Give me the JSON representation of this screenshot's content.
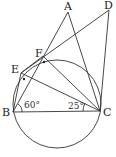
{
  "diagram": {
    "points": {
      "A": {
        "label": "A",
        "x": 68,
        "y": 12
      },
      "B": {
        "label": "B",
        "x": 13,
        "y": 112
      },
      "C": {
        "label": "C",
        "x": 100,
        "y": 111
      },
      "D": {
        "label": "D",
        "x": 109,
        "y": 10
      },
      "E": {
        "label": "E",
        "x": 21,
        "y": 73
      },
      "F": {
        "label": "F",
        "x": 43,
        "y": 56
      }
    },
    "circle": {
      "cx": 57,
      "cy": 116,
      "r": 44
    },
    "angles": {
      "B": "60°",
      "C": "25°"
    }
  }
}
